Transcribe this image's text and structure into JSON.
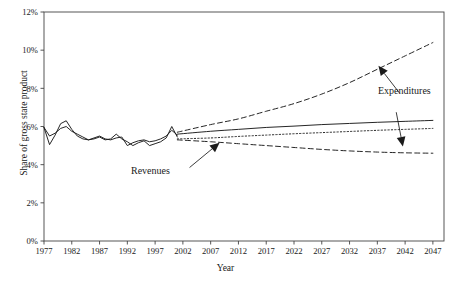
{
  "chart_data": {
    "type": "line",
    "title": "",
    "xlabel": "Year",
    "ylabel": "Share of gross state product",
    "xlim": [
      1977,
      2049
    ],
    "ylim": [
      0,
      12
    ],
    "grid": false,
    "legend_position": "inline-annotations",
    "y_tick_labels": [
      "0%",
      "2%",
      "4%",
      "6%",
      "8%",
      "10%",
      "12%"
    ],
    "y_tick_values": [
      0,
      2,
      4,
      6,
      8,
      10,
      12
    ],
    "x_tick_labels": [
      "1977",
      "1982",
      "1987",
      "1992",
      "1997",
      "2002",
      "2007",
      "2012",
      "2017",
      "2022",
      "2027",
      "2032",
      "2037",
      "2042",
      "2047"
    ],
    "x_tick_values": [
      1977,
      1982,
      1987,
      1992,
      1997,
      2002,
      2007,
      2012,
      2017,
      2022,
      2027,
      2032,
      2037,
      2042,
      2047
    ],
    "annotations": [
      {
        "text": "Revenues",
        "x": 2004,
        "y": 3.4,
        "arrow_to_x": 2009,
        "arrow_to_y": 5.3,
        "arrow_dir": "up-right"
      },
      {
        "text": "Expenditures",
        "x": 2042,
        "y": 7.3,
        "arrow_to_x": 2038,
        "arrow_to_y": 9.2,
        "arrow_dir": "up-left"
      },
      {
        "text": "Expenditures",
        "x": 2042,
        "y": 7.3,
        "arrow_to_x": 2042,
        "arrow_to_y": 4.9,
        "arrow_dir": "down"
      }
    ],
    "series": [
      {
        "name": "Historical revenues",
        "style": "solid",
        "segment": "historical",
        "x": [
          1977,
          1978,
          1979,
          1980,
          1981,
          1982,
          1983,
          1984,
          1985,
          1986,
          1987,
          1988,
          1989,
          1990,
          1991,
          1992,
          1993,
          1994,
          1995,
          1996,
          1997,
          1998,
          1999,
          2000,
          2001
        ],
        "values": [
          5.95,
          5.05,
          5.55,
          6.15,
          6.3,
          5.85,
          5.5,
          5.35,
          5.3,
          5.35,
          5.45,
          5.3,
          5.35,
          5.6,
          5.35,
          5.2,
          5.0,
          5.15,
          5.25,
          5.0,
          5.1,
          5.2,
          5.4,
          6.0,
          5.45
        ]
      },
      {
        "name": "Historical expenditures",
        "style": "solid",
        "segment": "historical",
        "x": [
          1977,
          1978,
          1979,
          1980,
          1981,
          1982,
          1983,
          1984,
          1985,
          1986,
          1987,
          1988,
          1989,
          1990,
          1991,
          1992,
          1993,
          1994,
          1995,
          1996,
          1997,
          1998,
          1999,
          2000,
          2001
        ],
        "values": [
          5.95,
          5.5,
          5.65,
          5.9,
          6.0,
          5.75,
          5.6,
          5.45,
          5.3,
          5.4,
          5.5,
          5.35,
          5.3,
          5.4,
          5.45,
          5.0,
          5.15,
          5.25,
          5.3,
          5.2,
          5.25,
          5.35,
          5.5,
          5.8,
          5.55
        ]
      },
      {
        "name": "Projected expenditures high",
        "style": "dashed",
        "segment": "projection",
        "x": [
          2001,
          2007,
          2012,
          2017,
          2022,
          2027,
          2032,
          2037,
          2042,
          2047
        ],
        "values": [
          5.7,
          6.1,
          6.4,
          6.8,
          7.2,
          7.7,
          8.3,
          9.0,
          9.7,
          10.4
        ]
      },
      {
        "name": "Projected expenditures central",
        "style": "solid",
        "segment": "projection",
        "x": [
          2001,
          2007,
          2012,
          2017,
          2022,
          2027,
          2032,
          2037,
          2042,
          2047
        ],
        "values": [
          5.6,
          5.75,
          5.85,
          5.95,
          6.02,
          6.1,
          6.16,
          6.22,
          6.27,
          6.32
        ]
      },
      {
        "name": "Projected revenues",
        "style": "dotted",
        "segment": "projection",
        "x": [
          2001,
          2007,
          2012,
          2017,
          2022,
          2027,
          2032,
          2037,
          2042,
          2047
        ],
        "values": [
          5.35,
          5.4,
          5.48,
          5.55,
          5.62,
          5.68,
          5.74,
          5.8,
          5.85,
          5.9
        ]
      },
      {
        "name": "Projected expenditures low",
        "style": "dashed",
        "segment": "projection",
        "x": [
          2001,
          2007,
          2012,
          2017,
          2022,
          2027,
          2032,
          2037,
          2042,
          2047
        ],
        "values": [
          5.3,
          5.2,
          5.1,
          5.0,
          4.9,
          4.8,
          4.72,
          4.66,
          4.62,
          4.6
        ]
      }
    ]
  },
  "axis": {
    "ylabel": "Share of gross state product",
    "xlabel": "Year"
  },
  "labels": {
    "revenues": "Revenues",
    "expenditures": "Expenditures"
  },
  "colors": {
    "line": "#1a1a1a",
    "axis": "#444444",
    "background": "#ffffff"
  }
}
